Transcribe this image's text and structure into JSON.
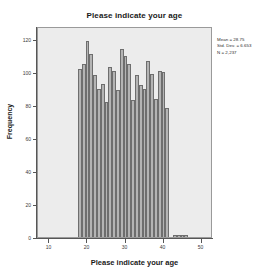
{
  "chart_data": {
    "type": "bar",
    "title": "Please indicate your age",
    "xlabel": "Please indicate your age",
    "ylabel": "Frequency",
    "xlim": [
      7,
      53
    ],
    "ylim": [
      0,
      128
    ],
    "grid": false,
    "legend": false,
    "x_ticks": [
      10,
      20,
      30,
      40,
      50
    ],
    "x_tick_labels": [
      "10",
      "20",
      "30",
      "40",
      "50"
    ],
    "y_ticks": [
      0,
      20,
      40,
      60,
      80,
      100,
      120
    ],
    "y_tick_labels": [
      "0",
      "20",
      "40",
      "60",
      "80",
      "100",
      "120"
    ],
    "bar_width": 1,
    "categories": [
      18,
      19,
      20,
      21,
      22,
      23,
      24,
      25,
      26,
      27,
      28,
      29,
      30,
      31,
      32,
      33,
      34,
      35,
      36,
      37,
      38,
      39,
      40,
      41,
      43,
      44,
      45,
      46
    ],
    "values": [
      102,
      105,
      119,
      111,
      98,
      90,
      93,
      82,
      103,
      101,
      89,
      114,
      110,
      105,
      83,
      98,
      92,
      90,
      107,
      99,
      84,
      101,
      100,
      78,
      1,
      1,
      1,
      1
    ],
    "series": [
      {
        "name": "Frequency",
        "values": [
          102,
          105,
          119,
          111,
          98,
          90,
          93,
          82,
          103,
          101,
          89,
          114,
          110,
          105,
          83,
          98,
          92,
          90,
          107,
          99,
          84,
          101,
          100,
          78,
          1,
          1,
          1,
          1
        ]
      }
    ],
    "annotations": {
      "mean_label": "Mean = 28.75",
      "std_dev_label": "Std. Dev. = 6.653",
      "n_label": "N = 2,237"
    },
    "colors": {
      "bar_fill": "#b4b4b4",
      "bar_edge": "#6e6e6e",
      "plot_background": "#ececec",
      "plot_border": "#9a9a9a",
      "axis": "#565656",
      "text": "#1a1a1a"
    }
  }
}
